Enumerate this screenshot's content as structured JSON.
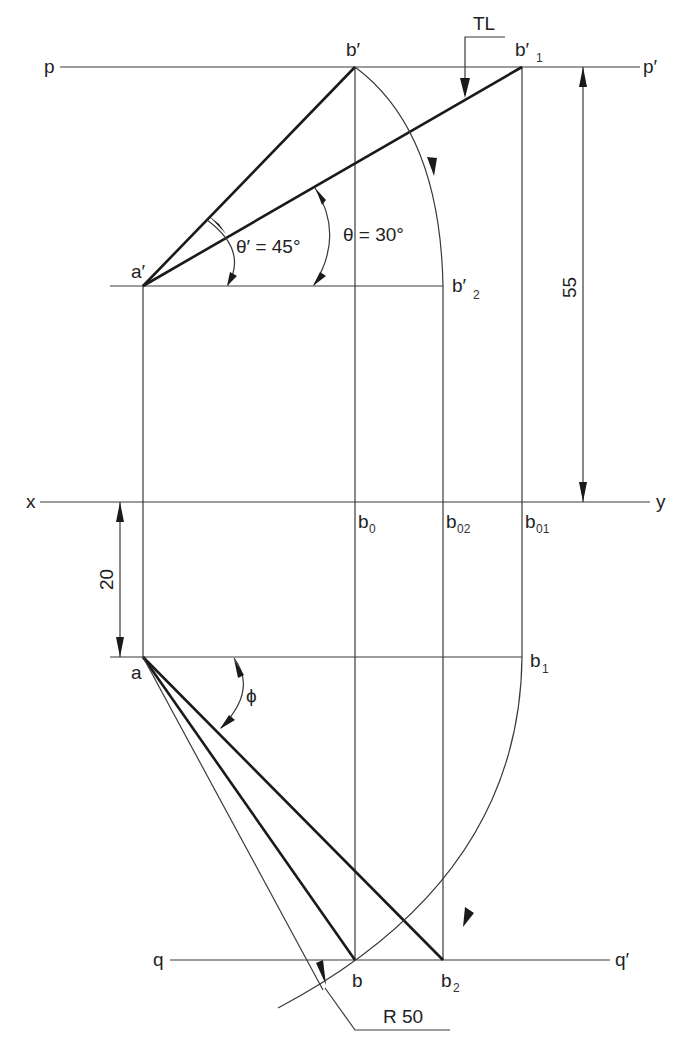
{
  "diagram": {
    "title": "",
    "type": "orthographic projection - line inclined to both HP and VP (true length method)",
    "colors": {
      "line": "#1a1a1a",
      "construction": "#3a3a3a",
      "background": "#ffffff"
    },
    "labels": {
      "p": "p",
      "p_prime": "p′",
      "q": "q",
      "q_prime": "q′",
      "x": "x",
      "y": "y",
      "a_prime": "a′",
      "a": "a",
      "b_prime": "b′",
      "b_prime_1_main": "b′",
      "b_prime_1_sub": "1",
      "b_prime_2_main": "b′",
      "b_prime_2_sub": "2",
      "b0_main": "b",
      "b0_sub": "0",
      "b02_main": "b",
      "b02_sub": "02",
      "b01_main": "b",
      "b01_sub": "01",
      "b1_main": "b",
      "b1_sub": "1",
      "b": "b",
      "b2_main": "b",
      "b2_sub": "2",
      "tl": "TL",
      "theta_prime": "θ′ = 45°",
      "theta": "θ = 30°",
      "phi": "ϕ",
      "dim_55": "55",
      "dim_20": "20",
      "radius": "R 50"
    }
  }
}
